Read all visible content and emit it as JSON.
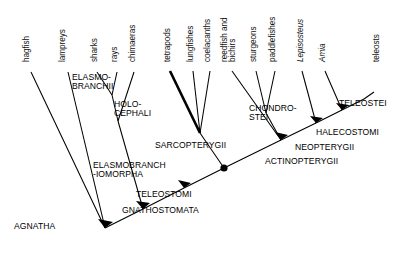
{
  "figure": {
    "type": "cladogram",
    "background_color": "#ffffff",
    "line_color": "#000000",
    "text_color": "#000000"
  },
  "tips": [
    {
      "id": "hagfish",
      "label": "hagfish",
      "x": 22,
      "y": 62,
      "lines": [
        "hagfish"
      ]
    },
    {
      "id": "lampreys",
      "label": "lampreys",
      "x": 58,
      "y": 62,
      "lines": [
        "lampreys"
      ]
    },
    {
      "id": "sharks",
      "label": "sharks",
      "x": 90,
      "y": 62,
      "lines": [
        "sharks"
      ]
    },
    {
      "id": "rays",
      "label": "rays",
      "x": 110,
      "y": 62,
      "lines": [
        "rays"
      ]
    },
    {
      "id": "chimaeras",
      "label": "chimaeras",
      "x": 128,
      "y": 62,
      "lines": [
        "chimaeras"
      ]
    },
    {
      "id": "tetrapods",
      "label": "tetrapods",
      "x": 163,
      "y": 62,
      "lines": [
        "tetrapods"
      ]
    },
    {
      "id": "lungfishes",
      "label": "lungfishes",
      "x": 186,
      "y": 62,
      "lines": [
        "lungfishes"
      ]
    },
    {
      "id": "coelacanths",
      "label": "coelacanths",
      "x": 203,
      "y": 62,
      "lines": [
        "coelacanths"
      ]
    },
    {
      "id": "reedfish",
      "label": "reedfish and bichirs",
      "x": 221,
      "y": 62,
      "lines": [
        "reedfish and",
        "bichirs"
      ]
    },
    {
      "id": "sturgeons",
      "label": "sturgeons",
      "x": 249,
      "y": 62,
      "lines": [
        "sturgeons"
      ]
    },
    {
      "id": "paddlefishes",
      "label": "paddlefishes",
      "x": 268,
      "y": 62,
      "lines": [
        "paddlefishes"
      ]
    },
    {
      "id": "lepisosteus",
      "label": "Lepisosteus",
      "x": 296,
      "y": 62,
      "lines": [
        "Lepisosteus"
      ],
      "italic": true
    },
    {
      "id": "amia",
      "label": "Amia",
      "x": 318,
      "y": 62,
      "lines": [
        "Amia"
      ],
      "italic": true
    },
    {
      "id": "teleosts",
      "label": "teleosts",
      "x": 372,
      "y": 62,
      "lines": [
        "teleosts"
      ]
    }
  ],
  "clades": [
    {
      "id": "agnatha",
      "label": "AGNATHA",
      "x": 14,
      "y": 222
    },
    {
      "id": "gnathostomata",
      "label": "GNATHOSTOMATA",
      "x": 122,
      "y": 206
    },
    {
      "id": "elasmobranchiomorpha",
      "label": "ELASMOBRANCH\n-IOMORPHA",
      "x": 93,
      "y": 161
    },
    {
      "id": "elasmobranchii",
      "label": "ELASMO-\nBRANCHII",
      "x": 72,
      "y": 73
    },
    {
      "id": "holocephali",
      "label": "HOLO-\nCEPHALI",
      "x": 114,
      "y": 100
    },
    {
      "id": "teleostomi",
      "label": "TELEOSTOMI",
      "x": 136,
      "y": 190
    },
    {
      "id": "sarcopterygii",
      "label": "SARCOPTERYGII",
      "x": 155,
      "y": 141
    },
    {
      "id": "actinopterygii",
      "label": "ACTINOPTERYGII",
      "x": 265,
      "y": 157
    },
    {
      "id": "chondrostei",
      "label": "CHONDRO-\nSTEI",
      "x": 249,
      "y": 104
    },
    {
      "id": "neopterygii",
      "label": "NEOPTERYGII",
      "x": 295,
      "y": 143
    },
    {
      "id": "halecostomi",
      "label": "HALECOSTOMI",
      "x": 316,
      "y": 128
    },
    {
      "id": "teleostei",
      "label": "TELEOSTEI",
      "x": 339,
      "y": 99
    }
  ],
  "branches": {
    "spine": "main diagonal axis from AGNATHA node to TELEOSTEI",
    "thick_branch": "tetrapods",
    "nodes": [
      "agnatha-node",
      "gnathostomata-node",
      "elasmobranchiomorpha-node",
      "teleostomi-node",
      "actinopterygii-node",
      "neopterygii-node",
      "halecostomi-node"
    ]
  }
}
